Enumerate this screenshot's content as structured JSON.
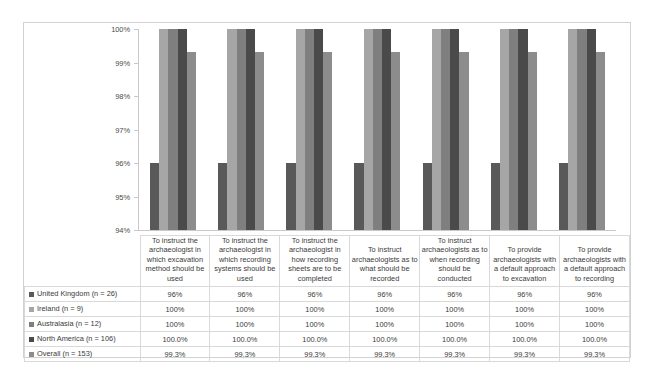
{
  "chart_data": {
    "type": "bar",
    "title": "",
    "xlabel": "",
    "ylabel": "",
    "ylim": [
      94,
      100
    ],
    "ytick_labels": [
      "100%",
      "99%",
      "98%",
      "97%",
      "96%",
      "95%",
      "94%"
    ],
    "ytick_values": [
      100,
      99,
      98,
      97,
      96,
      95,
      94
    ],
    "grid": false,
    "legend_position": "table-left",
    "categories": [
      "To instruct the archaeologist in which excavation method should be used",
      "To instruct the archaeologist in which recording systems should be used",
      "To instruct the archaeologist in how recording sheets are to be completed",
      "To instruct archaeologists as to what should be recorded",
      "To instruct archaeologists as to when recording should be conducted",
      "To provide archaeologists with a default approach to excavation",
      "To provide archaeologists with a default approach to recording"
    ],
    "series": [
      {
        "name": "United Kingdom (n = 26)",
        "color": "#595959",
        "values": [
          96,
          96,
          96,
          96,
          96,
          96,
          96
        ],
        "labels": [
          "96%",
          "96%",
          "96%",
          "96%",
          "96%",
          "96%",
          "96%"
        ]
      },
      {
        "name": "Ireland (n = 9)",
        "color": "#a6a6a6",
        "values": [
          100,
          100,
          100,
          100,
          100,
          100,
          100
        ],
        "labels": [
          "100%",
          "100%",
          "100%",
          "100%",
          "100%",
          "100%",
          "100%"
        ]
      },
      {
        "name": "Australasia (n = 12)",
        "color": "#7f7f7f",
        "values": [
          100,
          100,
          100,
          100,
          100,
          100,
          100
        ],
        "labels": [
          "100%",
          "100%",
          "100%",
          "100%",
          "100%",
          "100%",
          "100%"
        ]
      },
      {
        "name": "North America (n = 106)",
        "color": "#4a4a4a",
        "values": [
          100,
          100,
          100,
          100,
          100,
          100,
          100
        ],
        "labels": [
          "100.0%",
          "100.0%",
          "100.0%",
          "100.0%",
          "100.0%",
          "100.0%",
          "100.0%"
        ]
      },
      {
        "name": "Overall (n = 153)",
        "color": "#8c8c8c",
        "values": [
          99.3,
          99.3,
          99.3,
          99.3,
          99.3,
          99.3,
          99.3
        ],
        "labels": [
          "99.3%",
          "99.3%",
          "99.3%",
          "99.3%",
          "99.3%",
          "99.3%",
          "99.3%"
        ]
      }
    ]
  }
}
